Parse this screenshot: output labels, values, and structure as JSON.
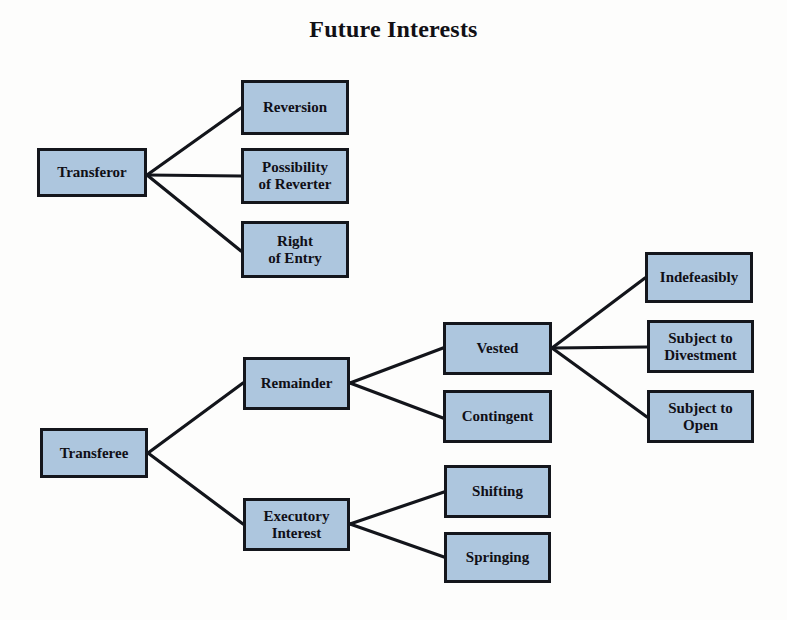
{
  "diagram": {
    "title": "Future Interests",
    "type": "tree",
    "orientation": "left-to-right",
    "background_color": "#fdfdfc",
    "node_fill_color": "#adc6de",
    "node_border_color": "#14161c",
    "text_color": "#100f16",
    "edge_color": "#13151b",
    "nodes": [
      {
        "id": "transferor",
        "label": "Transferor",
        "x": 37,
        "y": 148,
        "w": 110,
        "h": 49,
        "level": 0
      },
      {
        "id": "reversion",
        "label": "Reversion",
        "x": 241,
        "y": 80,
        "w": 108,
        "h": 55,
        "level": 1
      },
      {
        "id": "possibility",
        "label": "Possibility\nof Reverter",
        "x": 241,
        "y": 148,
        "w": 108,
        "h": 56,
        "level": 1
      },
      {
        "id": "rightentry",
        "label": "Right\nof Entry",
        "x": 241,
        "y": 221,
        "w": 108,
        "h": 57,
        "level": 1
      },
      {
        "id": "transferee",
        "label": "Transferee",
        "x": 40,
        "y": 428,
        "w": 108,
        "h": 50,
        "level": 0
      },
      {
        "id": "remainder",
        "label": "Remainder",
        "x": 243,
        "y": 357,
        "w": 107,
        "h": 53,
        "level": 1
      },
      {
        "id": "executory",
        "label": "Executory\nInterest",
        "x": 243,
        "y": 498,
        "w": 107,
        "h": 53,
        "level": 1
      },
      {
        "id": "vested",
        "label": "Vested",
        "x": 443,
        "y": 322,
        "w": 109,
        "h": 53,
        "level": 2
      },
      {
        "id": "contingent",
        "label": "Contingent",
        "x": 443,
        "y": 390,
        "w": 109,
        "h": 53,
        "level": 2
      },
      {
        "id": "shifting",
        "label": "Shifting",
        "x": 444,
        "y": 465,
        "w": 107,
        "h": 53,
        "level": 2
      },
      {
        "id": "springing",
        "label": "Springing",
        "x": 444,
        "y": 532,
        "w": 107,
        "h": 51,
        "level": 2
      },
      {
        "id": "indefeasibly",
        "label": "Indefeasibly",
        "x": 645,
        "y": 252,
        "w": 108,
        "h": 51,
        "level": 3
      },
      {
        "id": "divestment",
        "label": "Subject to\nDivestment",
        "x": 647,
        "y": 320,
        "w": 107,
        "h": 53,
        "level": 3
      },
      {
        "id": "open",
        "label": "Subject to\nOpen",
        "x": 647,
        "y": 390,
        "w": 107,
        "h": 53,
        "level": 3
      }
    ],
    "edges": [
      {
        "from": "transferor",
        "to": "reversion",
        "x1": 147,
        "y1": 175,
        "x2": 241,
        "y2": 108
      },
      {
        "from": "transferor",
        "to": "possibility",
        "x1": 147,
        "y1": 175,
        "x2": 241,
        "y2": 176
      },
      {
        "from": "transferor",
        "to": "rightentry",
        "x1": 147,
        "y1": 175,
        "x2": 241,
        "y2": 251
      },
      {
        "from": "transferee",
        "to": "remainder",
        "x1": 148,
        "y1": 453,
        "x2": 243,
        "y2": 383
      },
      {
        "from": "transferee",
        "to": "executory",
        "x1": 148,
        "y1": 453,
        "x2": 243,
        "y2": 524
      },
      {
        "from": "remainder",
        "to": "vested",
        "x1": 350,
        "y1": 383,
        "x2": 443,
        "y2": 348
      },
      {
        "from": "remainder",
        "to": "contingent",
        "x1": 350,
        "y1": 383,
        "x2": 443,
        "y2": 418
      },
      {
        "from": "executory",
        "to": "shifting",
        "x1": 350,
        "y1": 524,
        "x2": 444,
        "y2": 492
      },
      {
        "from": "executory",
        "to": "springing",
        "x1": 350,
        "y1": 524,
        "x2": 444,
        "y2": 557
      },
      {
        "from": "vested",
        "to": "indefeasibly",
        "x1": 552,
        "y1": 348,
        "x2": 645,
        "y2": 278
      },
      {
        "from": "vested",
        "to": "divestment",
        "x1": 552,
        "y1": 348,
        "x2": 647,
        "y2": 347
      },
      {
        "from": "vested",
        "to": "open",
        "x1": 552,
        "y1": 348,
        "x2": 647,
        "y2": 417
      }
    ]
  }
}
